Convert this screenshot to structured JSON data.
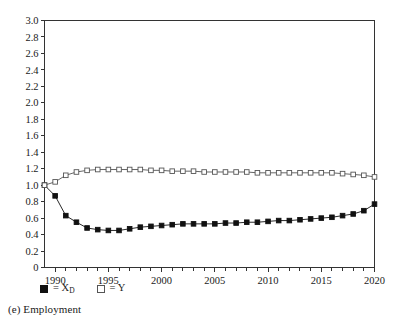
{
  "caption": "(e) Employment",
  "legend": {
    "entries": [
      {
        "marker": "filled-square",
        "label_prefix": "= X",
        "label_sub": "D",
        "name": "X_D"
      },
      {
        "marker": "open-square",
        "label_prefix": "= Y",
        "label_sub": "",
        "name": "Y"
      }
    ]
  },
  "chart_data": {
    "type": "line",
    "title": "",
    "subtitle": "",
    "xlabel": "",
    "ylabel": "",
    "xlim": [
      1989,
      2020
    ],
    "ylim": [
      0,
      3.0
    ],
    "grid": false,
    "legend_position": "below-axis-left",
    "x_tick_labels": [
      "1990",
      "1995",
      "2000",
      "2005",
      "2010",
      "2015",
      "2020"
    ],
    "x_tick_values": [
      1990,
      1995,
      2000,
      2005,
      2010,
      2015,
      2020
    ],
    "x_minor_ticks_every": 1,
    "y_tick_labels": [
      "0",
      "0.2",
      "0.4",
      "0.6",
      "0.8",
      "1.0",
      "1.2",
      "1.4",
      "1.6",
      "1.8",
      "2.0",
      "2.2",
      "2.4",
      "2.6",
      "2.8",
      "3.0"
    ],
    "y_tick_values": [
      0,
      0.2,
      0.4,
      0.6,
      0.8,
      1.0,
      1.2,
      1.4,
      1.6,
      1.8,
      2.0,
      2.2,
      2.4,
      2.6,
      2.8,
      3.0
    ],
    "x": [
      1989,
      1990,
      1991,
      1992,
      1993,
      1994,
      1995,
      1996,
      1997,
      1998,
      1999,
      2000,
      2001,
      2002,
      2003,
      2004,
      2005,
      2006,
      2007,
      2008,
      2009,
      2010,
      2011,
      2012,
      2013,
      2014,
      2015,
      2016,
      2017,
      2018,
      2019,
      2020
    ],
    "series": [
      {
        "name": "X_D",
        "marker": "filled-square",
        "color": "#111111",
        "values": [
          1.0,
          0.87,
          0.63,
          0.55,
          0.48,
          0.46,
          0.45,
          0.45,
          0.47,
          0.49,
          0.5,
          0.51,
          0.52,
          0.53,
          0.53,
          0.53,
          0.53,
          0.54,
          0.54,
          0.55,
          0.55,
          0.56,
          0.57,
          0.57,
          0.58,
          0.59,
          0.6,
          0.61,
          0.63,
          0.65,
          0.69,
          0.77
        ]
      },
      {
        "name": "Y",
        "marker": "open-square",
        "color": "#555555",
        "values": [
          1.0,
          1.04,
          1.12,
          1.16,
          1.18,
          1.19,
          1.19,
          1.19,
          1.19,
          1.19,
          1.18,
          1.18,
          1.17,
          1.17,
          1.17,
          1.16,
          1.16,
          1.16,
          1.16,
          1.16,
          1.15,
          1.15,
          1.15,
          1.15,
          1.15,
          1.15,
          1.15,
          1.15,
          1.14,
          1.13,
          1.12,
          1.1
        ]
      }
    ]
  }
}
